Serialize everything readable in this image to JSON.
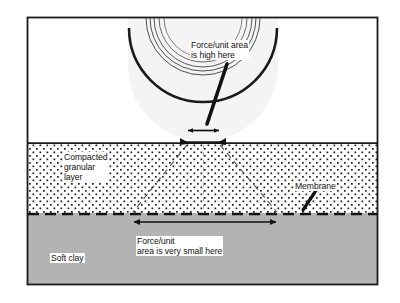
{
  "figure": {
    "frame": {
      "x": 27,
      "y": 17,
      "width": 351,
      "height": 268,
      "border_color": "#1a1a1a",
      "background": "#ffffff"
    },
    "layers": [
      {
        "name": "air-above-ground",
        "label": "",
        "fill": "#ffffff",
        "top": 17,
        "bottom": 143
      },
      {
        "name": "compacted-granular-layer",
        "label": "Compacted\ngranular\nlayer",
        "label_lines": [
          "Compacted",
          "granular",
          "layer"
        ],
        "fill": "#ffffff",
        "pattern": "stipple-dots",
        "top": 143,
        "bottom": 213
      },
      {
        "name": "soft-clay-layer",
        "label": "Soft clay",
        "fill": "#b3b3b3",
        "pattern": "solid-gray",
        "top": 213,
        "bottom": 285
      }
    ],
    "membrane": {
      "label": "Membrane",
      "style": "dashed-line",
      "color": "#111111",
      "y": 214
    },
    "wheel": {
      "name": "tire",
      "center_x": 203,
      "center_y": 66,
      "outer_radius": 77,
      "tread_lugs": 16,
      "contact_patch_width": 34
    },
    "annotations": [
      {
        "name": "force-high",
        "lines": [
          "Force/unit area",
          "is high here"
        ],
        "text": "Force/unit area is high here"
      },
      {
        "name": "force-low",
        "lines": [
          "Force/unit",
          "area is very small here"
        ],
        "text": "Force/unit area is very small here"
      },
      {
        "name": "membrane-callout",
        "lines": [
          "Membrane"
        ],
        "text": "Membrane"
      }
    ],
    "dimension_arrows": [
      {
        "name": "contact-width-arrow",
        "x1": 186,
        "x2": 221,
        "y": 131,
        "label_ref": "force-high"
      },
      {
        "name": "spread-width-arrow",
        "x1": 132,
        "x2": 278,
        "y": 222,
        "label_ref": "force-low"
      }
    ],
    "load_spread_lines": [
      {
        "name": "spread-line-left",
        "x1": 187,
        "y1": 144,
        "x2": 133,
        "y2": 212
      },
      {
        "name": "spread-line-right",
        "x1": 220,
        "y1": 144,
        "x2": 277,
        "y2": 212
      },
      {
        "name": "center-line",
        "x1": 203,
        "y1": 144,
        "x2": 203,
        "y2": 212
      }
    ],
    "colors": {
      "frame": "#1a1a1a",
      "clay": "#b3b3b3",
      "granular": "#ffffff",
      "dots": "#1f1f1f",
      "ink": "#111111"
    },
    "labels": {
      "force_high_line1": "Force/unit area",
      "force_high_line2": "is high here",
      "compacted_line1": "Compacted",
      "compacted_line2": "granular",
      "compacted_line3": "layer",
      "membrane": "Membrane",
      "force_low_line1": "Force/unit",
      "force_low_line2": "area is very small here",
      "soft_clay": "Soft clay"
    }
  }
}
